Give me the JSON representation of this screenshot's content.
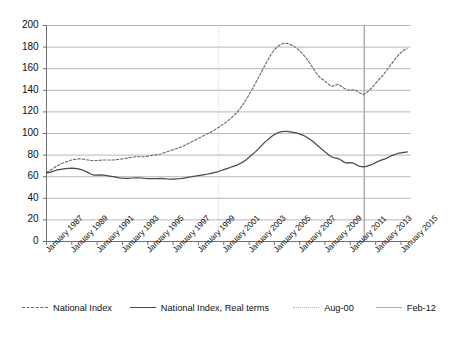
{
  "chart_data": {
    "type": "line",
    "title": "",
    "subtitle": "",
    "xlabel": "",
    "ylabel": "",
    "ylim": [
      0,
      200
    ],
    "ytick_step": 20,
    "grid": true,
    "legend_position": "bottom",
    "yticks": [
      "200",
      "180",
      "160",
      "140",
      "120",
      "100",
      "80",
      "60",
      "40",
      "20",
      "0"
    ],
    "xticks": [
      "January 1987",
      "January 1989",
      "January 1991",
      "January 1993",
      "January 1995",
      "January 1997",
      "January 1999",
      "January 2001",
      "January 2003",
      "January 2005",
      "January 2007",
      "January 2009",
      "January 2011",
      "January 2013",
      "January 2015"
    ],
    "x_start_year": 1987,
    "x_end_year": 2015.75,
    "colors": {
      "national_index": "#6d6d6d",
      "national_index_real": "#4a4a4a",
      "aug_00_marker": "#c8c8c8",
      "feb_12_marker": "#b0b0b0",
      "gridline": "#9a9a9a",
      "axis": "#6f6f6f"
    },
    "series": [
      {
        "name": "National Index",
        "style": "dashed",
        "x": [
          1987.0,
          1987.25,
          1987.5,
          1987.75,
          1988.0,
          1988.25,
          1988.5,
          1988.75,
          1989.0,
          1989.25,
          1989.5,
          1989.75,
          1990.0,
          1990.25,
          1990.5,
          1990.75,
          1991.0,
          1991.25,
          1991.5,
          1991.75,
          1992.0,
          1992.25,
          1992.5,
          1992.75,
          1993.0,
          1993.25,
          1993.5,
          1993.75,
          1994.0,
          1994.25,
          1994.5,
          1994.75,
          1995.0,
          1995.25,
          1995.5,
          1995.75,
          1996.0,
          1996.25,
          1996.5,
          1996.75,
          1997.0,
          1997.25,
          1997.5,
          1997.75,
          1998.0,
          1998.25,
          1998.5,
          1998.75,
          1999.0,
          1999.25,
          1999.5,
          1999.75,
          2000.0,
          2000.25,
          2000.5,
          2000.75,
          2001.0,
          2001.25,
          2001.5,
          2001.75,
          2002.0,
          2002.25,
          2002.5,
          2002.75,
          2003.0,
          2003.25,
          2003.5,
          2003.75,
          2004.0,
          2004.25,
          2004.5,
          2004.75,
          2005.0,
          2005.25,
          2005.5,
          2005.75,
          2006.0,
          2006.25,
          2006.5,
          2006.75,
          2007.0,
          2007.25,
          2007.5,
          2007.75,
          2008.0,
          2008.25,
          2008.5,
          2008.75,
          2009.0,
          2009.25,
          2009.5,
          2009.75,
          2010.0,
          2010.25,
          2010.5,
          2010.75,
          2011.0,
          2011.25,
          2011.5,
          2011.75,
          2012.0,
          2012.25,
          2012.5,
          2012.75,
          2013.0,
          2013.25,
          2013.5,
          2013.75,
          2014.0,
          2014.25,
          2014.5,
          2014.75,
          2015.0,
          2015.25,
          2015.5
        ],
        "values": [
          64.0,
          65.5,
          67.5,
          69.5,
          71.0,
          72.5,
          73.5,
          74.5,
          75.5,
          76.0,
          76.5,
          76.5,
          76.0,
          75.5,
          75.0,
          75.0,
          75.0,
          75.2,
          75.5,
          75.5,
          75.5,
          75.5,
          75.8,
          76.0,
          76.5,
          77.0,
          77.5,
          78.0,
          78.5,
          78.5,
          78.5,
          78.5,
          79.0,
          79.5,
          80.0,
          80.5,
          81.0,
          82.0,
          83.0,
          84.0,
          85.0,
          86.0,
          87.0,
          88.0,
          89.5,
          91.0,
          92.5,
          94.0,
          95.5,
          97.0,
          98.5,
          100.0,
          101.5,
          103.0,
          105.0,
          107.0,
          109.0,
          111.0,
          113.5,
          116.0,
          119.0,
          122.5,
          126.5,
          131.0,
          136.0,
          141.0,
          146.5,
          152.0,
          157.5,
          163.0,
          168.5,
          173.5,
          177.5,
          180.5,
          182.5,
          183.5,
          183.5,
          182.5,
          181.0,
          179.0,
          176.5,
          173.5,
          170.0,
          166.0,
          161.5,
          157.0,
          153.0,
          150.5,
          148.5,
          146.0,
          143.5,
          144.5,
          145.5,
          144.0,
          142.0,
          140.5,
          140.0,
          140.5,
          139.5,
          137.5,
          136.0,
          137.5,
          140.0,
          143.0,
          146.5,
          150.0,
          153.0,
          156.5,
          160.5,
          164.5,
          168.5,
          172.0,
          175.0,
          177.5,
          178.5
        ]
      },
      {
        "name": "National Index, Real terms",
        "style": "solid",
        "x": [
          1987.0,
          1987.25,
          1987.5,
          1987.75,
          1988.0,
          1988.25,
          1988.5,
          1988.75,
          1989.0,
          1989.25,
          1989.5,
          1989.75,
          1990.0,
          1990.25,
          1990.5,
          1990.75,
          1991.0,
          1991.25,
          1991.5,
          1991.75,
          1992.0,
          1992.25,
          1992.5,
          1992.75,
          1993.0,
          1993.25,
          1993.5,
          1993.75,
          1994.0,
          1994.25,
          1994.5,
          1994.75,
          1995.0,
          1995.25,
          1995.5,
          1995.75,
          1996.0,
          1996.25,
          1996.5,
          1996.75,
          1997.0,
          1997.25,
          1997.5,
          1997.75,
          1998.0,
          1998.25,
          1998.5,
          1998.75,
          1999.0,
          1999.25,
          1999.5,
          1999.75,
          2000.0,
          2000.25,
          2000.5,
          2000.75,
          2001.0,
          2001.25,
          2001.5,
          2001.75,
          2002.0,
          2002.25,
          2002.5,
          2002.75,
          2003.0,
          2003.25,
          2003.5,
          2003.75,
          2004.0,
          2004.25,
          2004.5,
          2004.75,
          2005.0,
          2005.25,
          2005.5,
          2005.75,
          2006.0,
          2006.25,
          2006.5,
          2006.75,
          2007.0,
          2007.25,
          2007.5,
          2007.75,
          2008.0,
          2008.25,
          2008.5,
          2008.75,
          2009.0,
          2009.25,
          2009.5,
          2009.75,
          2010.0,
          2010.25,
          2010.5,
          2010.75,
          2011.0,
          2011.25,
          2011.5,
          2011.75,
          2012.0,
          2012.25,
          2012.5,
          2012.75,
          2013.0,
          2013.25,
          2013.5,
          2013.75,
          2014.0,
          2014.25,
          2014.5,
          2014.75,
          2015.0,
          2015.25,
          2015.5
        ],
        "values": [
          63.5,
          64.0,
          65.0,
          66.0,
          66.5,
          67.0,
          67.5,
          67.8,
          68.0,
          67.8,
          67.2,
          66.5,
          65.5,
          64.0,
          62.5,
          61.5,
          61.5,
          61.8,
          61.5,
          61.0,
          60.5,
          60.0,
          59.5,
          59.0,
          58.7,
          58.5,
          58.5,
          58.8,
          59.0,
          59.0,
          58.8,
          58.5,
          58.3,
          58.2,
          58.2,
          58.3,
          58.5,
          58.3,
          58.0,
          57.8,
          57.8,
          58.0,
          58.2,
          58.5,
          59.0,
          59.5,
          60.0,
          60.5,
          61.0,
          61.5,
          62.0,
          62.5,
          63.0,
          63.8,
          64.5,
          65.5,
          66.5,
          67.5,
          68.5,
          69.5,
          70.5,
          72.0,
          73.5,
          75.5,
          78.0,
          80.5,
          83.0,
          86.0,
          89.0,
          92.0,
          94.5,
          97.0,
          99.0,
          100.5,
          101.5,
          102.0,
          102.0,
          101.5,
          101.0,
          100.5,
          99.5,
          98.5,
          97.0,
          95.0,
          93.0,
          90.5,
          88.0,
          85.5,
          83.0,
          80.5,
          78.5,
          77.5,
          77.0,
          75.5,
          73.5,
          72.5,
          73.0,
          72.5,
          71.0,
          69.5,
          69.0,
          69.5,
          70.5,
          71.5,
          73.0,
          74.5,
          75.5,
          76.5,
          78.0,
          79.5,
          80.5,
          81.5,
          82.0,
          82.5,
          83.0
        ]
      }
    ],
    "vertical_markers": [
      {
        "name": "Aug-00",
        "x": 2000.6,
        "style": "dotted",
        "color": "#c8c8c8"
      },
      {
        "name": "Feb-12",
        "x": 2012.1,
        "style": "solid",
        "color": "#b0b0b0"
      }
    ],
    "legend": [
      {
        "label": "National Index",
        "swatch": "dashed"
      },
      {
        "label": "National Index, Real terms",
        "swatch": "solid"
      },
      {
        "label": "Aug-00",
        "swatch": "dotted"
      },
      {
        "label": "Feb-12",
        "swatch": "line-light"
      }
    ]
  }
}
